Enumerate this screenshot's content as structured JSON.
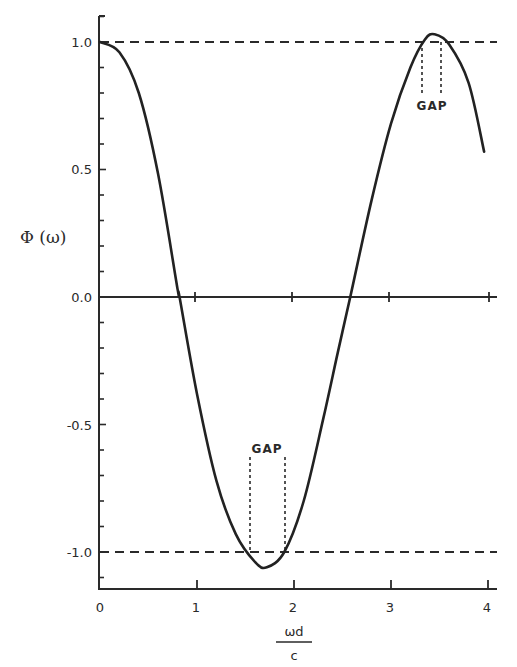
{
  "chart_data": {
    "type": "line",
    "title": "",
    "xlabel": "ωd / c",
    "ylabel": "Φ(ω)",
    "xlim": [
      0,
      4.1
    ],
    "ylim": [
      -1.15,
      1.1
    ],
    "x_ticks": [
      "0",
      "1",
      "2",
      "3",
      "4"
    ],
    "y_ticks": [
      "1.0",
      "0.5",
      "0.0",
      "-0.5",
      "-1.0"
    ],
    "grid": false,
    "series": [
      {
        "name": "Φ(ω)",
        "x": [
          0,
          0.2,
          0.4,
          0.6,
          0.8,
          0.82,
          1.0,
          1.2,
          1.4,
          1.6,
          1.72,
          1.9,
          2.1,
          2.3,
          2.45,
          2.58,
          2.8,
          3.0,
          3.2,
          3.35,
          3.45,
          3.6,
          3.8,
          3.96
        ],
        "values": [
          1.0,
          0.96,
          0.8,
          0.48,
          0.03,
          0.0,
          -0.38,
          -0.72,
          -0.93,
          -1.04,
          -1.06,
          -1.0,
          -0.8,
          -0.48,
          -0.22,
          0.0,
          0.38,
          0.68,
          0.9,
          1.01,
          1.03,
          0.99,
          0.84,
          0.57
        ]
      }
    ],
    "reference_lines": [
      {
        "y": 1.0,
        "style": "dashed"
      },
      {
        "y": 0.0,
        "style": "solid"
      },
      {
        "y": -1.0,
        "style": "dashed"
      }
    ],
    "annotations": [
      {
        "text": "GAP",
        "x_range": [
          1.55,
          1.91
        ],
        "y_line": -1.0,
        "label_y": -0.6
      },
      {
        "text": "GAP",
        "x_range": [
          3.33,
          3.52
        ],
        "y_line": 1.0,
        "label_y": 0.8
      }
    ]
  },
  "labels": {
    "y_axis": "Φ (ω)",
    "x_axis_num": "ωd",
    "x_axis_den": "c",
    "gap_lower": "GAP",
    "gap_upper": "GAP",
    "yt_1": "1.0",
    "yt_05": "0.5",
    "yt_0": "0.0",
    "yt_m05": "-0.5",
    "yt_m1": "-1.0",
    "xt_0": "0",
    "xt_1": "1",
    "xt_2": "2",
    "xt_3": "3",
    "xt_4": "4"
  }
}
